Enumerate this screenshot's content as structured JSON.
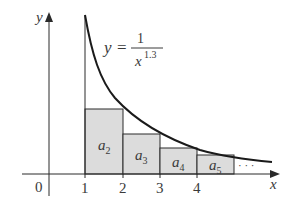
{
  "diagram": {
    "equation": {
      "lhs": "y",
      "equals": "=",
      "numerator": "1",
      "denominator_base": "x",
      "denominator_exponent": "1.3"
    },
    "axes": {
      "x_label": "x",
      "y_label": "y",
      "origin_label": "0"
    },
    "x_ticks": [
      "1",
      "2",
      "3",
      "4"
    ],
    "rectangles": [
      {
        "label_base": "a",
        "label_sub": "2",
        "x_from": 1,
        "x_to": 2
      },
      {
        "label_base": "a",
        "label_sub": "3",
        "x_from": 2,
        "x_to": 3
      },
      {
        "label_base": "a",
        "label_sub": "4",
        "x_from": 3,
        "x_to": 4
      },
      {
        "label_base": "a",
        "label_sub": "5",
        "x_from": 4,
        "x_to": 5
      }
    ],
    "continuation": "· · ·",
    "colors": {
      "fill": "#dcdcdc",
      "stroke": "#2a2a2a"
    }
  }
}
